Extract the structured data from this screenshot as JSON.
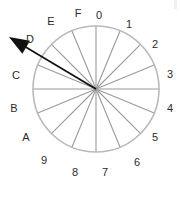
{
  "figure": {
    "name": "hex-direction-dial",
    "background_color": "#ffffff"
  },
  "chart_data": {
    "type": "pie",
    "title": "",
    "subtitle": "",
    "xlabel": "",
    "ylabel": "",
    "sector_count": 16,
    "degrees_per_sector": 22.5,
    "categories": [
      "0",
      "1",
      "2",
      "3",
      "4",
      "5",
      "6",
      "7",
      "8",
      "9",
      "A",
      "B",
      "C",
      "D",
      "E",
      "F"
    ],
    "values": [
      1,
      1,
      1,
      1,
      1,
      1,
      1,
      1,
      1,
      1,
      1,
      1,
      1,
      1,
      1,
      1
    ],
    "tick_labels": [
      {
        "text": "0",
        "angle_deg": 0,
        "x": 99,
        "y": 15
      },
      {
        "text": "1",
        "angle_deg": 22.5,
        "x": 129,
        "y": 24
      },
      {
        "text": "2",
        "angle_deg": 45,
        "x": 155,
        "y": 44
      },
      {
        "text": "3",
        "angle_deg": 67.5,
        "x": 170,
        "y": 74
      },
      {
        "text": "4",
        "angle_deg": 90,
        "x": 170,
        "y": 108
      },
      {
        "text": "5",
        "angle_deg": 112.5,
        "x": 155,
        "y": 137
      },
      {
        "text": "6",
        "angle_deg": 135,
        "x": 137,
        "y": 162
      },
      {
        "text": "7",
        "angle_deg": 157.5,
        "x": 105,
        "y": 172
      },
      {
        "text": "8",
        "angle_deg": 180,
        "x": 75,
        "y": 172
      },
      {
        "text": "9",
        "angle_deg": 202.5,
        "x": 44,
        "y": 160
      },
      {
        "text": "A",
        "angle_deg": 225,
        "x": 26,
        "y": 137
      },
      {
        "text": "B",
        "angle_deg": 247.5,
        "x": 14,
        "y": 108
      },
      {
        "text": "C",
        "angle_deg": 270,
        "x": 16,
        "y": 75
      },
      {
        "text": "D",
        "angle_deg": 292.5,
        "x": 30,
        "y": 39
      },
      {
        "text": "E",
        "angle_deg": 315,
        "x": 51,
        "y": 21
      },
      {
        "text": "F",
        "angle_deg": 337.5,
        "x": 78,
        "y": 13
      }
    ],
    "arrow": {
      "label": "D",
      "points_to": "D",
      "direction_deg": 292.5,
      "color": "#111111",
      "origin": {
        "x": 96,
        "y": 89
      },
      "tip": {
        "x": 9,
        "y": 37
      },
      "extends_beyond_rim": true
    },
    "circle": {
      "center_x": 96,
      "center_y": 89,
      "radius": 63,
      "stroke_color": "#b9b9b9",
      "fill": "none",
      "spoke_color": "#9a9a9a"
    },
    "grid": true,
    "legend": null
  }
}
